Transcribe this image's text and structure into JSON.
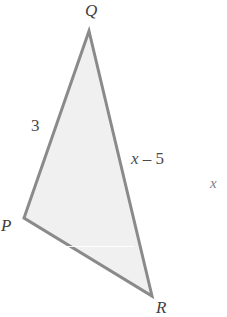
{
  "figure": {
    "type": "geometry-diagram",
    "shape": "triangle",
    "background_color": "#ffffff",
    "fill_color": "#f0f0f0",
    "stroke_color": "#8a8a8a",
    "stroke_width": 3,
    "text_color": "#4a4a4a",
    "vertices": [
      {
        "name": "Q",
        "label": "Q",
        "x": 89,
        "y": 31
      },
      {
        "name": "P",
        "label": "P",
        "x": 24,
        "y": 218
      },
      {
        "name": "R",
        "label": "R",
        "x": 152,
        "y": 296
      }
    ],
    "side_labels": [
      {
        "name": "side-PQ",
        "label": "3",
        "x": 31,
        "y": 117
      },
      {
        "name": "side-QR",
        "label": "x – 5",
        "x": 131,
        "y": 150
      }
    ],
    "stray_text": {
      "name": "stray-x",
      "label": "x",
      "x": 210,
      "y": 176
    }
  },
  "labels": {
    "Q": "Q",
    "P": "P",
    "R": "R",
    "side_3": "3",
    "side_x_minus_5_var": "x",
    "side_x_minus_5_rest": " – 5",
    "stray_x": "x"
  }
}
